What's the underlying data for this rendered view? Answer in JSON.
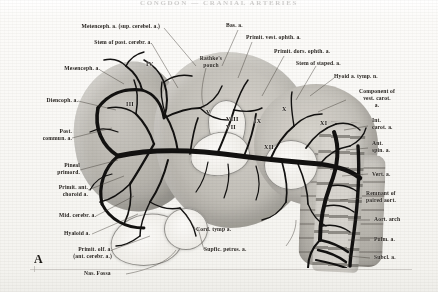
{
  "plate": {
    "running_head": "CONGDON — CRANIAL ARTERIES",
    "figure_letter": "A",
    "width": 438,
    "height": 292,
    "ink_color": "#121110",
    "paper_color": "#f8f7f4",
    "label_color": "#26221d"
  },
  "labels_left": [
    {
      "text": "Metenceph. a. (sup. cerebel. a.)",
      "x": 56,
      "y": 26
    },
    {
      "text": "Stem of post. cerebr. a.",
      "x": 62,
      "y": 42
    },
    {
      "text": "Mesenceph. a.",
      "x": 38,
      "y": 68
    },
    {
      "text": "Diencoph. a.",
      "x": 24,
      "y": 100
    },
    {
      "text": "Post.\ncommun. a.",
      "x": 20,
      "y": 132
    },
    {
      "text": "Pineal\nprimord.",
      "x": 44,
      "y": 165
    },
    {
      "text": "Primit. ant.\nchoroid a.",
      "x": 42,
      "y": 186
    },
    {
      "text": "Mid. cerebr. a.",
      "x": 42,
      "y": 214
    },
    {
      "text": "Hyaloid a.",
      "x": 55,
      "y": 232
    },
    {
      "text": "Primit. olf. a.\n(ant. cerebr. a.)",
      "x": 56,
      "y": 248
    },
    {
      "text": "Nas. Fossa",
      "x": 88,
      "y": 272
    }
  ],
  "labels_top": [
    {
      "text": "Bas. a.",
      "x": 228,
      "y": 25
    },
    {
      "text": "Primit. vest. ophth. a.",
      "x": 246,
      "y": 36
    },
    {
      "text": "Primit. dors. ophth. a.",
      "x": 268,
      "y": 50
    },
    {
      "text": "Stem of staped. a.",
      "x": 288,
      "y": 60
    },
    {
      "text": "Rathke's\npouch",
      "x": 196,
      "y": 56
    }
  ],
  "labels_right": [
    {
      "text": "Hyoid a. tymp. n.",
      "x": 336,
      "y": 76
    },
    {
      "text": "Component of\nvest. carot.\na.",
      "x": 350,
      "y": 92
    },
    {
      "text": "Int.\ncarot. a.",
      "x": 372,
      "y": 120
    },
    {
      "text": "Ant.\nspin. a.",
      "x": 372,
      "y": 142
    },
    {
      "text": "Vert. a.",
      "x": 372,
      "y": 172
    },
    {
      "text": "Remnant of\npaired aort.",
      "x": 366,
      "y": 192
    },
    {
      "text": "Aort. arch",
      "x": 374,
      "y": 218
    },
    {
      "text": "Pulm. a.",
      "x": 374,
      "y": 238
    },
    {
      "text": "Subcl. a.",
      "x": 374,
      "y": 256
    }
  ],
  "labels_bottom": [
    {
      "text": "Cord. tymp a.",
      "x": 196,
      "y": 228
    },
    {
      "text": "Supfic. petros. a.",
      "x": 204,
      "y": 248
    }
  ],
  "cranial_nerves": [
    {
      "numeral": "IV",
      "x": 146,
      "y": 64
    },
    {
      "numeral": "III",
      "x": 127,
      "y": 104
    },
    {
      "numeral": "V",
      "x": 206,
      "y": 112
    },
    {
      "numeral": "VIII",
      "x": 228,
      "y": 118
    },
    {
      "numeral": "VII",
      "x": 228,
      "y": 126
    },
    {
      "numeral": "IX",
      "x": 254,
      "y": 120
    },
    {
      "numeral": "X",
      "x": 282,
      "y": 108
    },
    {
      "numeral": "XI",
      "x": 321,
      "y": 122
    },
    {
      "numeral": "XII",
      "x": 265,
      "y": 146
    }
  ]
}
